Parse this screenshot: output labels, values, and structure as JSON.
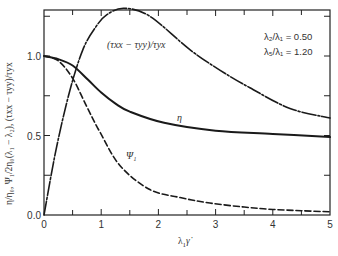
{
  "chart_data": {
    "type": "line",
    "title": "",
    "xlabel": "λ₁γ̇",
    "ylabel": "η/η₀, Ψ₁/2η₀(λ₁ − λ₂), (τxx − τyy)/τyx",
    "xlim": [
      0,
      5
    ],
    "ylim": [
      0,
      1.3
    ],
    "x_ticks": [
      "0",
      "1",
      "2",
      "3",
      "4",
      "5"
    ],
    "y_ticks": [
      "0.0",
      "0.5",
      "1.0"
    ],
    "grid": false,
    "legend": null,
    "annotations": [
      {
        "text": "λ₂/λ₁ = 0.50",
        "x": 3.9,
        "y": 1.17
      },
      {
        "text": "λ₅/λ₁ = 1.20",
        "x": 3.9,
        "y": 1.07
      },
      {
        "text": "(τxx − τyy)/τyx",
        "x": 1.6,
        "y": 1.1
      },
      {
        "text": "η",
        "x": 2.35,
        "y": 0.61
      },
      {
        "text": "Ψ₁",
        "x": 1.45,
        "y": 0.36
      }
    ],
    "series": [
      {
        "name": "η",
        "style": "solid",
        "x": [
          0,
          0.25,
          0.5,
          0.77,
          1.0,
          1.25,
          1.5,
          2.1,
          3.0,
          4.0,
          5.0
        ],
        "y": [
          1.0,
          0.98,
          0.94,
          0.85,
          0.77,
          0.7,
          0.65,
          0.58,
          0.53,
          0.51,
          0.49
        ]
      },
      {
        "name": "Ψ₁",
        "style": "dashed",
        "x": [
          0,
          0.25,
          0.5,
          0.75,
          0.98,
          1.33,
          1.85,
          2.38,
          2.9,
          3.5,
          4.0,
          4.5,
          5.0
        ],
        "y": [
          1.0,
          0.97,
          0.86,
          0.68,
          0.52,
          0.31,
          0.16,
          0.11,
          0.075,
          0.05,
          0.035,
          0.027,
          0.02
        ]
      },
      {
        "name": "(τxx − τyy)/τyx",
        "style": "dash-dot",
        "x": [
          0,
          0.21,
          0.45,
          0.68,
          0.9,
          1.1,
          1.4,
          1.85,
          2.55,
          3.08,
          3.6,
          4.3,
          5.0
        ],
        "y": [
          0,
          0.41,
          0.78,
          1.04,
          1.18,
          1.26,
          1.3,
          1.25,
          1.04,
          0.91,
          0.8,
          0.67,
          0.61
        ]
      }
    ]
  },
  "labels": {
    "x_axis": "λ",
    "x_axis_sub": "1",
    "x_axis_var": "γ̇",
    "y_axis": "η/η₀, Ψ₁/2η₀(λ₁ − λ₂), (τxx − τyy)/τyx",
    "param1": "λ₂/λ₁ = 0.50",
    "param2": "λ₅/λ₁ = 1.20",
    "curve_stress": "(τxx − τyy)/τyx",
    "curve_eta": "η",
    "curve_psi": "Ψ₁"
  }
}
